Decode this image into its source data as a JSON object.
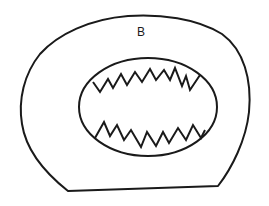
{
  "diagram": {
    "label": "B",
    "stroke_color": "#1a1a1a",
    "background": "#ffffff",
    "shapes": {
      "outer_boundary": "rounded-irregular closed outline with flat bottom edge",
      "inner_ellipse": "central ellipse",
      "upper_zigzag": "serrated line across upper part of ellipse",
      "lower_zigzag": "serrated line across lower part of ellipse"
    }
  }
}
